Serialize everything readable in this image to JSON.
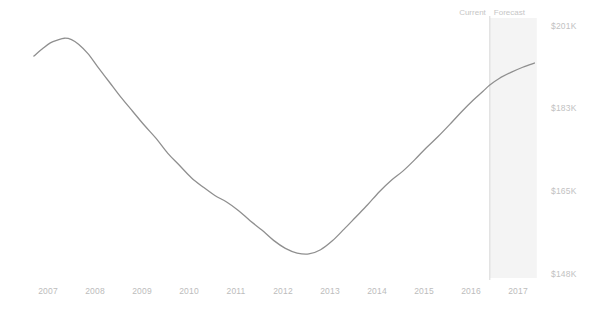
{
  "chart_data": {
    "type": "line",
    "title": "",
    "subtitle": "",
    "xlabel": "",
    "ylabel": "",
    "grid": false,
    "legend_position": "none",
    "x_tick_labels": [
      "2007",
      "2008",
      "2009",
      "2010",
      "2011",
      "2012",
      "2013",
      "2014",
      "2015",
      "2016",
      "2017"
    ],
    "y_tick_labels": [
      "$201K",
      "$183K",
      "$165K",
      "$148K"
    ],
    "ylim": [
      148000,
      201000
    ],
    "yticks": [
      201000,
      183000,
      165000,
      148000
    ],
    "xlim": [
      "2006.6",
      "2017.6"
    ],
    "annotations": [
      {
        "name": "current",
        "text": "Current",
        "x": "2016.4"
      },
      {
        "name": "forecast",
        "text": "Forecast",
        "x": "2016.4"
      }
    ],
    "forecast_region": {
      "start": "2016.4",
      "end": "2017.4",
      "fill": "#f4f4f4"
    },
    "divider_x": "2016.4",
    "line_color": "#8f8f8f",
    "series": [
      {
        "name": "Home Value",
        "x": [
          "2006.70",
          "2006.90",
          "2007.05",
          "2007.20",
          "2007.35",
          "2007.50",
          "2007.65",
          "2007.85",
          "2008.05",
          "2008.30",
          "2008.55",
          "2008.80",
          "2009.05",
          "2009.30",
          "2009.55",
          "2009.80",
          "2010.05",
          "2010.30",
          "2010.55",
          "2010.80",
          "2011.05",
          "2011.30",
          "2011.55",
          "2011.80",
          "2012.05",
          "2012.30",
          "2012.55",
          "2012.80",
          "2013.05",
          "2013.30",
          "2013.55",
          "2013.80",
          "2014.05",
          "2014.30",
          "2014.55",
          "2014.80",
          "2015.05",
          "2015.30",
          "2015.55",
          "2015.80",
          "2016.05",
          "2016.25",
          "2016.40",
          "2016.60",
          "2016.85",
          "2017.10",
          "2017.35"
        ],
        "values": [
          194800,
          196500,
          197600,
          198200,
          198600,
          198300,
          197300,
          195300,
          192600,
          189300,
          186000,
          183000,
          180000,
          177200,
          174000,
          171400,
          168800,
          166800,
          165000,
          163600,
          161800,
          159600,
          157600,
          155400,
          153700,
          152700,
          152500,
          153400,
          155300,
          157800,
          160400,
          163000,
          165800,
          168200,
          170200,
          172600,
          175200,
          177600,
          180200,
          182900,
          185400,
          187200,
          188600,
          190000,
          191300,
          192400,
          193300
        ]
      }
    ]
  },
  "axes": {
    "y_ticks": [
      {
        "label": "$201K",
        "top": 22
      },
      {
        "label": "$183K",
        "top": 104
      },
      {
        "label": "$165K",
        "top": 187
      },
      {
        "label": "$148K",
        "top": 270
      }
    ],
    "x_ticks": [
      {
        "label": "2007",
        "left": 48
      },
      {
        "label": "2008",
        "left": 95
      },
      {
        "label": "2009",
        "left": 142
      },
      {
        "label": "2010",
        "left": 189
      },
      {
        "label": "2011",
        "left": 236
      },
      {
        "label": "2012",
        "left": 283
      },
      {
        "label": "2013",
        "left": 330
      },
      {
        "label": "2014",
        "left": 377
      },
      {
        "label": "2015",
        "left": 424
      },
      {
        "label": "2016",
        "left": 471
      },
      {
        "label": "2017",
        "left": 518
      }
    ]
  },
  "divider": {
    "current_label": "Current",
    "forecast_label": "Forecast"
  },
  "colors": {
    "line": "#8f8f8f",
    "forecast_fill": "#f4f4f4",
    "divider": "#d8d8d8",
    "tick_text": "#bdbdbd",
    "background": "#ffffff"
  }
}
